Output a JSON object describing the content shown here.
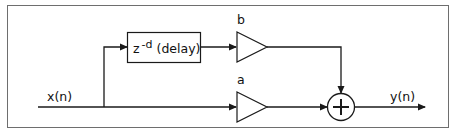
{
  "diagram": {
    "type": "signal-flow block diagram",
    "colors": {
      "stroke": "#1a1a1a",
      "frame": "#6e6e6e",
      "background": "#ffffff"
    },
    "input": {
      "label": "x(n)"
    },
    "output": {
      "label": "y(n)"
    },
    "delay_block": {
      "base": "z",
      "exponent": "-d",
      "suffix": "(delay)"
    },
    "gains": {
      "feedforward": {
        "label": "b"
      },
      "direct": {
        "label": "a"
      }
    },
    "summer": {
      "symbol": "+"
    }
  }
}
